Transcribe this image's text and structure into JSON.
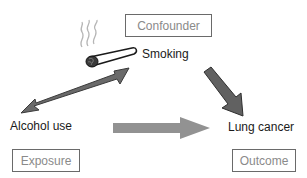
{
  "diagram": {
    "roles": {
      "confounder": "Confounder",
      "exposure": "Exposure",
      "outcome": "Outcome"
    },
    "variables": {
      "smoking": "Smoking",
      "alcohol": "Alcohol use",
      "lung_cancer": "Lung cancer"
    },
    "edges": [
      {
        "from": "Smoking",
        "to": "Alcohol use",
        "type": "bidirectional"
      },
      {
        "from": "Smoking",
        "to": "Lung cancer",
        "type": "directed"
      },
      {
        "from": "Alcohol use",
        "to": "Lung cancer",
        "type": "directed",
        "style": "light-gray"
      }
    ],
    "icons": [
      "cigarette-icon",
      "smoke-icon"
    ],
    "colors": {
      "arrow_dark": "#5a5a5a",
      "arrow_light": "#8e8e8e",
      "box_border": "#6a6a6a",
      "role_text": "#8a8a8a",
      "variable_text": "#1a1a1a"
    }
  }
}
